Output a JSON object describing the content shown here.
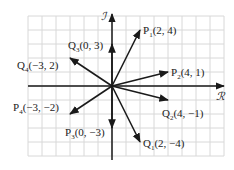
{
  "diagram": {
    "axes": {
      "horizontal": "ℛ",
      "vertical": "ℐ"
    },
    "grid": {
      "x_range": [
        -6,
        8
      ],
      "y_range": [
        -5,
        5
      ],
      "spacing_px": 14,
      "origin_px": [
        112,
        86
      ],
      "line_color": "#d8d8d8"
    },
    "arrow_color": "#1a1a1a",
    "points": [
      {
        "name": "P",
        "sub": "1",
        "coords": "(2, 4)",
        "x": 2,
        "y": 4
      },
      {
        "name": "P",
        "sub": "2",
        "coords": "(4, 1)",
        "x": 4,
        "y": 1
      },
      {
        "name": "P",
        "sub": "3",
        "coords": "(0, −3)",
        "x": 0,
        "y": -3
      },
      {
        "name": "P",
        "sub": "4",
        "coords": "(−3, −2)",
        "x": -3,
        "y": -2
      },
      {
        "name": "Q",
        "sub": "1",
        "coords": "(2, −4)",
        "x": 2,
        "y": -4
      },
      {
        "name": "Q",
        "sub": "2",
        "coords": "(4, −1)",
        "x": 4,
        "y": -1
      },
      {
        "name": "Q",
        "sub": "3",
        "coords": "(0, 3)",
        "x": 0,
        "y": 3
      },
      {
        "name": "Q",
        "sub": "4",
        "coords": "(−3, 2)",
        "x": -3,
        "y": 2
      }
    ]
  }
}
